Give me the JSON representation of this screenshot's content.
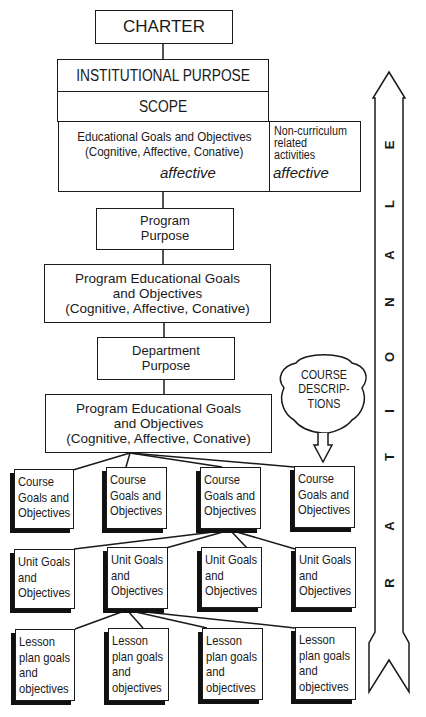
{
  "diagram": {
    "charter": "CHARTER",
    "institutional_purpose": "INSTITUTIONAL PURPOSE",
    "scope": "SCOPE",
    "educational_goals": {
      "line1": "Educational Goals and Objectives",
      "line2": "(Cognitive, Affective, Conative)"
    },
    "affective_left": "affective",
    "affective_right": "affective",
    "non_curriculum": {
      "line1": "Non-curriculum",
      "line2": "related",
      "line3": "activities"
    },
    "program_purpose": {
      "line1": "Program",
      "line2": "Purpose"
    },
    "program_goals_1": {
      "line1": "Program Educational Goals",
      "line2": "and Objectives",
      "line3": "(Cognitive, Affective, Conative)"
    },
    "department_purpose": {
      "line1": "Department",
      "line2": "Purpose"
    },
    "program_goals_2": {
      "line1": "Program Educational Goals",
      "line2": "and Objectives",
      "line3": "(Cognitive, Affective, Conative)"
    },
    "course_descriptions": {
      "line1": "COURSE",
      "line2": "DESCRIP-",
      "line3": "TIONS"
    },
    "course_goals": [
      {
        "line1": "Course",
        "line2": "Goals and",
        "line3": "Objectives"
      },
      {
        "line1": "Course",
        "line2": "Goals and",
        "line3": "Objectives"
      },
      {
        "line1": "Course",
        "line2": "Goals and",
        "line3": "Objectives"
      },
      {
        "line1": "Course",
        "line2": "Goals and",
        "line3": "Objectives"
      }
    ],
    "unit_goals": [
      {
        "line1": "Unit Goals",
        "line2": "and",
        "line3": "Objectives"
      },
      {
        "line1": "Unit Goals",
        "line2": "and",
        "line3": "Objectives"
      },
      {
        "line1": "Unit Goals",
        "line2": "and",
        "line3": "Objectives"
      },
      {
        "line1": "Unit Goals",
        "line2": "and",
        "line3": "Objectives"
      }
    ],
    "lesson_goals": [
      {
        "line1": "Lesson",
        "line2": "plan goals",
        "line3": "and",
        "line4": "objectives"
      },
      {
        "line1": "Lesson",
        "line2": "plan goals",
        "line3": "and",
        "line4": "objectives"
      },
      {
        "line1": "Lesson",
        "line2": "plan goals",
        "line3": "and",
        "line4": "objectives"
      },
      {
        "line1": "Lesson",
        "line2": "plan goals",
        "line3": "and",
        "line4": "objectives"
      }
    ],
    "rationale_letters": [
      "R",
      "A",
      "T",
      "I",
      "O",
      "N",
      "A",
      "L",
      "E"
    ],
    "colors": {
      "ink": "#1a1a1a",
      "background": "#ffffff",
      "shadow": "#111111"
    }
  }
}
